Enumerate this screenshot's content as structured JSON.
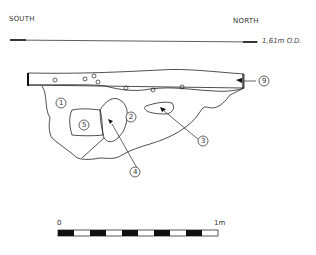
{
  "drawing": {
    "orientation_left": "SOUTH",
    "orientation_right": "NORTH",
    "datum_label": "1,61m O.D.",
    "layers": [
      {
        "id": "1",
        "label": "1"
      },
      {
        "id": "2",
        "label": "2"
      },
      {
        "id": "3",
        "label": "3"
      },
      {
        "id": "4",
        "label": "4"
      },
      {
        "id": "5",
        "label": "5"
      },
      {
        "id": "9",
        "label": "9"
      }
    ]
  },
  "scale_bar": {
    "start_label": "0",
    "end_label": "1m",
    "segments": 10
  }
}
